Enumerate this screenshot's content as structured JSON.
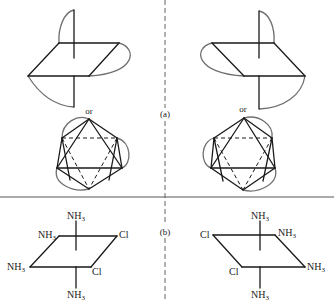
{
  "figure": {
    "panel_labels": {
      "a": "(a)",
      "b": "(b)"
    },
    "connector_label": "or",
    "colors": {
      "line": "#1a1a1a",
      "chelate_arc": "#6f6f6f",
      "divider": "#555555"
    }
  },
  "panel_a": {
    "left": {
      "connector": "or"
    },
    "right": {
      "connector": "or"
    }
  },
  "panel_b": {
    "left": {
      "ligands": {
        "top": "NH",
        "top_sub": "3",
        "back_left": "NH",
        "back_left_sub": "3",
        "back_right": "Cl",
        "front_left": "NH",
        "front_left_sub": "3",
        "front_right": "Cl",
        "bottom": "NH",
        "bottom_sub": "3"
      }
    },
    "right": {
      "ligands": {
        "top": "NH",
        "top_sub": "3",
        "back_left": "Cl",
        "back_right": "NH",
        "back_right_sub": "3",
        "front_left": "Cl",
        "front_right": "NH",
        "front_right_sub": "3",
        "bottom": "NH",
        "bottom_sub": "3"
      }
    }
  }
}
